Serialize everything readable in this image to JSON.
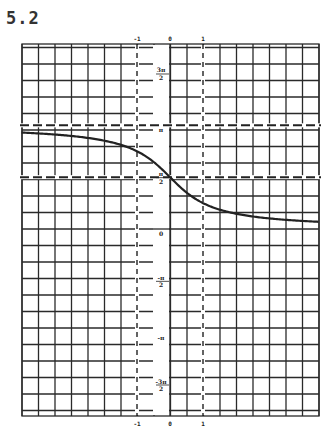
{
  "figure": {
    "label": "5.2"
  },
  "chart_data": {
    "type": "line",
    "title": "5.2",
    "xlabel": "",
    "ylabel": "",
    "function_description": "y = arccot(x) = π/2 − arctan(x)",
    "x_ticks": [
      "-1",
      "0",
      "1"
    ],
    "y_ticks": [
      "3π/2",
      "π",
      "π/2",
      "0",
      "-π/2",
      "-π",
      "-3π/2"
    ],
    "xlim": [
      -4.5,
      4.5
    ],
    "ylim": [
      -5.6,
      5.6
    ],
    "grid": true,
    "asymptotes": [
      {
        "type": "horizontal",
        "y": 3.1416,
        "label": "π",
        "style": "dashed"
      },
      {
        "type": "horizontal",
        "y": 1.5708,
        "label": "π/2",
        "style": "dashed"
      },
      {
        "type": "vertical",
        "x": -1,
        "style": "dashed"
      },
      {
        "type": "vertical",
        "x": 1,
        "style": "dashed"
      }
    ],
    "series": [
      {
        "name": "arccot(x)",
        "x": [
          -4.5,
          -4,
          -3,
          -2,
          -1.5,
          -1,
          -0.5,
          0,
          0.5,
          1,
          1.5,
          2,
          3,
          4,
          4.5
        ],
        "y": [
          2.92,
          2.9,
          2.82,
          2.68,
          2.55,
          2.36,
          2.03,
          1.57,
          1.11,
          0.79,
          0.59,
          0.46,
          0.32,
          0.24,
          0.22
        ]
      }
    ]
  },
  "labels": {
    "x_top": [
      "-1",
      "0",
      "1"
    ],
    "x_bottom": [
      "-1",
      "0",
      "1"
    ],
    "y": {
      "three_pi_over_2": {
        "num": "3π",
        "den": "2"
      },
      "pi": "π",
      "pi_over_2": {
        "num": "π",
        "den": "2"
      },
      "zero": "0",
      "neg_pi_over_2": {
        "num": "-π",
        "den": "2"
      },
      "neg_pi": "-π",
      "neg_three_pi_over_2": {
        "num": "-3π",
        "den": "2"
      }
    }
  }
}
